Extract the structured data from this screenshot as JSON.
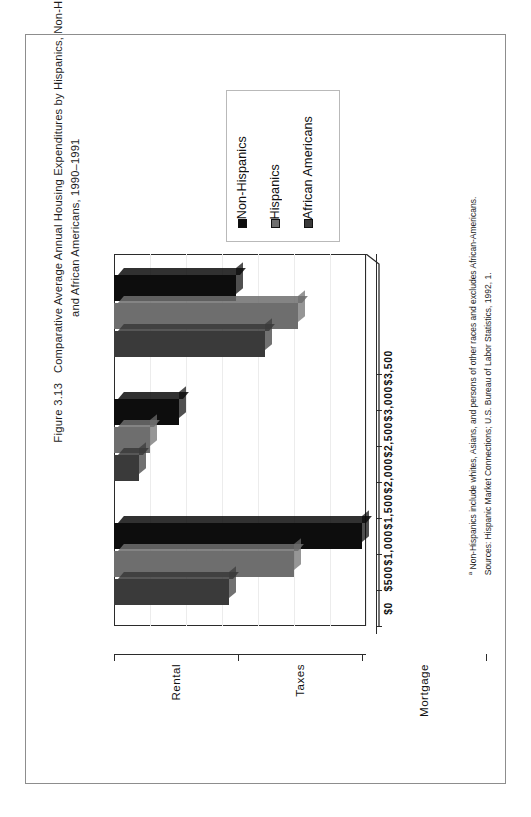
{
  "figure": {
    "number": "Figure 3.13",
    "title_line1": "Comparative Average Annual Housing Expenditures by Hispanics, Non-Hispanics",
    "title_marker": "a",
    "title_line2": "and African Americans, 1990–1991"
  },
  "legend": {
    "items": [
      {
        "label": "Non-Hispanics",
        "color": "#0d0d0d"
      },
      {
        "label": "Hispanics",
        "color": "#6e6e6e"
      },
      {
        "label": "African Americans",
        "color": "#3a3a3a"
      }
    ]
  },
  "notes": {
    "footnote_marker": "a",
    "footnote": " Non-Hispanics include whites, Asians, and persons of other races and excludes African-Americans.",
    "sources": "Sources: Hispanic Market Connections; U.S. Bureau of Labor Statistics, 1992, 1."
  },
  "chart_data": {
    "type": "bar",
    "xlabel": "",
    "ylabel": "",
    "orientation": "rotated-90",
    "grid": true,
    "legend_position": "top",
    "categories": [
      "Rental",
      "Taxes",
      "Mortgage"
    ],
    "ylim": [
      0,
      3500
    ],
    "yticks": [
      0,
      500,
      1000,
      1500,
      2000,
      2500,
      3000,
      3500
    ],
    "ytick_labels": [
      "$0",
      "$500",
      "$1,000",
      "$1,500",
      "$2,000",
      "$2,500",
      "$3,000",
      "$3,500"
    ],
    "series": [
      {
        "name": "Non-Hispanics",
        "color": "#0d0d0d",
        "values": [
          1700,
          900,
          3450
        ]
      },
      {
        "name": "Hispanics",
        "color": "#6e6e6e",
        "values": [
          2550,
          500,
          2500
        ]
      },
      {
        "name": "African Americans",
        "color": "#3a3a3a",
        "values": [
          2100,
          350,
          1600
        ]
      }
    ]
  }
}
